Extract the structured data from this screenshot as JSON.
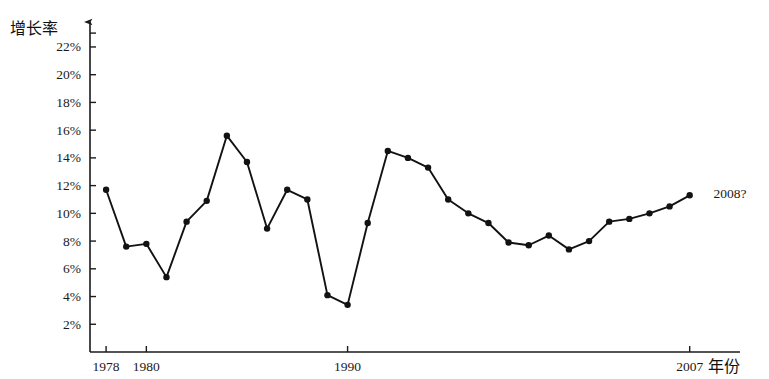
{
  "chart_data": {
    "type": "line",
    "title": "",
    "subtitle": "",
    "xlabel": "年份",
    "ylabel": "增长率",
    "x": [
      1978,
      1979,
      1980,
      1981,
      1982,
      1983,
      1984,
      1985,
      1986,
      1987,
      1988,
      1989,
      1990,
      1991,
      1992,
      1993,
      1994,
      1995,
      1996,
      1997,
      1998,
      1999,
      2000,
      2001,
      2002,
      2003,
      2004,
      2005,
      2006,
      2007
    ],
    "values": [
      11.7,
      7.6,
      7.8,
      5.4,
      9.4,
      10.9,
      15.6,
      13.7,
      8.9,
      11.7,
      11.0,
      4.1,
      3.4,
      9.3,
      14.5,
      14.0,
      13.3,
      11.0,
      10.0,
      9.3,
      7.9,
      7.7,
      8.4,
      7.4,
      8.0,
      9.4,
      9.6,
      10.0,
      10.5,
      11.3
    ],
    "series": [
      {
        "name": "增长率",
        "values": [
          11.7,
          7.6,
          7.8,
          5.4,
          9.4,
          10.9,
          15.6,
          13.7,
          8.9,
          11.7,
          11.0,
          4.1,
          3.4,
          9.3,
          14.5,
          14.0,
          13.3,
          11.0,
          10.0,
          9.3,
          7.9,
          7.7,
          8.4,
          7.4,
          8.0,
          9.4,
          9.6,
          10.0,
          10.5,
          11.3
        ]
      }
    ],
    "x_tick_labels": [
      "1978",
      "1980",
      "1990",
      "2007"
    ],
    "x_tick_values": [
      1978,
      1980,
      1990,
      2007
    ],
    "y_tick_labels": [
      "2%",
      "4%",
      "6%",
      "8%",
      "10%",
      "12%",
      "14%",
      "16%",
      "18%",
      "20%",
      "22%"
    ],
    "y_tick_values": [
      2,
      4,
      6,
      8,
      10,
      12,
      14,
      16,
      18,
      20,
      22
    ],
    "xlim": [
      1977.2,
      2009.5
    ],
    "ylim": [
      0,
      23.8
    ],
    "grid": false,
    "legend": "none",
    "annotations": [
      {
        "text": "2008?",
        "x": 2009.0,
        "y": 11.4
      }
    ],
    "line_color": "#121212",
    "marker_color": "#121212",
    "axis_color": "#1b1b1b",
    "background_color": "#ffffff"
  }
}
